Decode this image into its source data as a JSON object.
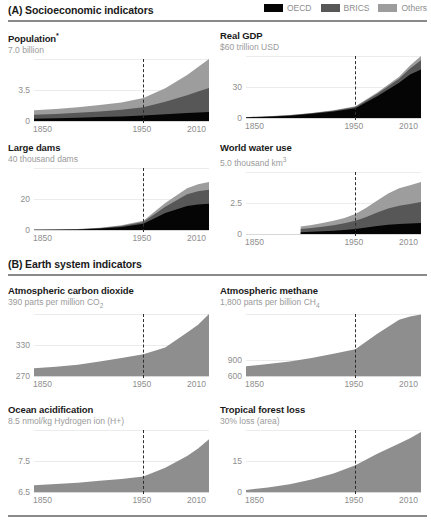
{
  "figure": {
    "sections": [
      {
        "id": "A",
        "label": "(A) Socioeconomic indicators",
        "has_legend": true,
        "legend": [
          {
            "name": "OECD",
            "color": "#050505"
          },
          {
            "name": "BRICS",
            "color": "#575757"
          },
          {
            "name": "Others",
            "color": "#9d9d9d"
          }
        ]
      },
      {
        "id": "B",
        "label": "(B) Earth system indicators",
        "has_legend": false,
        "legend": []
      }
    ]
  },
  "chart_data": [
    {
      "type": "area",
      "stacked": true,
      "title": "Population",
      "title_footnote": "*",
      "subtitle": "7.0 billion",
      "xlabel": "",
      "ylabel": "",
      "xlim": [
        1850,
        2010
      ],
      "ylim": [
        0,
        7.0
      ],
      "xticks": [
        1850,
        1950,
        2010
      ],
      "yticks": [
        0,
        3.5
      ],
      "grid": true,
      "annotation_year": 1950,
      "x": [
        1850,
        1870,
        1890,
        1910,
        1930,
        1950,
        1970,
        1990,
        2000,
        2010
      ],
      "series": [
        {
          "name": "OECD",
          "values": [
            0.25,
            0.3,
            0.36,
            0.44,
            0.52,
            0.62,
            0.76,
            0.9,
            0.97,
            1.03
          ]
        },
        {
          "name": "BRICS",
          "values": [
            0.45,
            0.5,
            0.56,
            0.64,
            0.74,
            0.92,
            1.4,
            2.0,
            2.35,
            2.7
          ]
        },
        {
          "name": "Others",
          "values": [
            0.5,
            0.55,
            0.62,
            0.72,
            0.84,
            1.06,
            1.54,
            2.3,
            2.78,
            3.27
          ]
        }
      ],
      "totals": [
        1.2,
        1.35,
        1.54,
        1.8,
        2.1,
        2.6,
        3.7,
        5.2,
        6.1,
        7.0
      ]
    },
    {
      "type": "area",
      "stacked": true,
      "title": "Real GDP",
      "subtitle": "$60 trillion USD",
      "xlim": [
        1850,
        2010
      ],
      "ylim": [
        0,
        60
      ],
      "xticks": [
        1850,
        1950,
        2010
      ],
      "yticks": [
        0,
        30
      ],
      "grid": true,
      "annotation_year": 1950,
      "x": [
        1850,
        1870,
        1890,
        1910,
        1930,
        1950,
        1970,
        1990,
        2000,
        2010
      ],
      "series": [
        {
          "name": "OECD",
          "values": [
            0.6,
            1.2,
            2.2,
            4.0,
            6.2,
            9.5,
            21.0,
            34.0,
            42.0,
            47.0
          ]
        },
        {
          "name": "BRICS",
          "values": [
            0.2,
            0.3,
            0.4,
            0.6,
            0.8,
            1.2,
            2.4,
            4.0,
            6.0,
            9.0
          ]
        },
        {
          "name": "Others",
          "values": [
            0.1,
            0.2,
            0.2,
            0.3,
            0.4,
            0.6,
            1.2,
            2.0,
            2.8,
            4.0
          ]
        }
      ],
      "totals": [
        0.9,
        1.7,
        2.8,
        4.9,
        7.4,
        11.3,
        24.6,
        40.0,
        50.8,
        60.0
      ]
    },
    {
      "type": "area",
      "stacked": true,
      "title": "Large dams",
      "subtitle": "40 thousand dams",
      "xlim": [
        1850,
        2010
      ],
      "ylim": [
        0,
        40
      ],
      "xticks": [
        1850,
        1950,
        2010
      ],
      "yticks": [
        0,
        20
      ],
      "grid": true,
      "annotation_year": 1950,
      "x": [
        1850,
        1870,
        1890,
        1910,
        1930,
        1950,
        1970,
        1990,
        2000,
        2010
      ],
      "series": [
        {
          "name": "OECD",
          "values": [
            0.1,
            0.2,
            0.4,
            0.9,
            2.0,
            4.0,
            11.0,
            15.5,
            16.5,
            17.0
          ]
        },
        {
          "name": "BRICS",
          "values": [
            0.0,
            0.1,
            0.1,
            0.3,
            0.6,
            1.2,
            4.0,
            7.5,
            8.5,
            9.0
          ]
        },
        {
          "name": "Others",
          "values": [
            0.0,
            0.0,
            0.1,
            0.2,
            0.4,
            0.8,
            2.5,
            4.0,
            4.5,
            5.0
          ]
        }
      ],
      "totals": [
        0.1,
        0.3,
        0.6,
        1.4,
        3.0,
        6.0,
        17.5,
        27.0,
        29.5,
        31.0
      ]
    },
    {
      "type": "area",
      "stacked": true,
      "title": "World water use",
      "subtitle_prefix": "5.0 thousand km",
      "subtitle_sup": "3",
      "subtitle": "5.0 thousand km3",
      "xlim": [
        1850,
        2010
      ],
      "ylim": [
        0,
        5.0
      ],
      "xticks": [
        1850,
        1950,
        2010
      ],
      "yticks": [
        0,
        2.5
      ],
      "grid": true,
      "annotation_year": 1950,
      "data_starts": 1900,
      "x": [
        1900,
        1910,
        1920,
        1930,
        1940,
        1950,
        1960,
        1970,
        1980,
        1990,
        2000,
        2010
      ],
      "series": [
        {
          "name": "OECD",
          "values": [
            0.15,
            0.18,
            0.22,
            0.26,
            0.32,
            0.4,
            0.52,
            0.64,
            0.74,
            0.8,
            0.84,
            0.88
          ]
        },
        {
          "name": "BRICS",
          "values": [
            0.25,
            0.3,
            0.36,
            0.44,
            0.54,
            0.66,
            0.86,
            1.1,
            1.32,
            1.48,
            1.58,
            1.7
          ]
        },
        {
          "name": "Others",
          "values": [
            0.2,
            0.24,
            0.3,
            0.36,
            0.44,
            0.56,
            0.74,
            0.96,
            1.2,
            1.4,
            1.52,
            1.62
          ]
        }
      ],
      "totals": [
        0.6,
        0.72,
        0.88,
        1.06,
        1.3,
        1.62,
        2.12,
        2.7,
        3.26,
        3.68,
        3.94,
        4.2
      ]
    },
    {
      "type": "area",
      "stacked": false,
      "title": "Atmospheric carbon dioxide",
      "subtitle_prefix": "390 parts per million CO",
      "subtitle_sub": "2",
      "subtitle": "390 parts per million CO2",
      "xlim": [
        1850,
        2010
      ],
      "ylim": [
        270,
        390
      ],
      "xticks": [
        1850,
        1950,
        2010
      ],
      "yticks": [
        270,
        330
      ],
      "grid": true,
      "annotation_year": 1950,
      "x": [
        1850,
        1870,
        1890,
        1910,
        1930,
        1950,
        1970,
        1990,
        2000,
        2010
      ],
      "values": [
        285,
        288,
        292,
        298,
        305,
        312,
        325,
        354,
        369,
        390
      ]
    },
    {
      "type": "area",
      "stacked": false,
      "title": "Atmospheric methane",
      "subtitle_prefix": "1,800 parts per billion CH",
      "subtitle_sub": "4",
      "subtitle": "1,800 parts per billion CH4",
      "xlim": [
        1850,
        2010
      ],
      "ylim": [
        600,
        1800
      ],
      "xticks": [
        1850,
        1950,
        2010
      ],
      "yticks": [
        600,
        900
      ],
      "grid": true,
      "annotation_year": 1950,
      "x": [
        1850,
        1870,
        1890,
        1910,
        1930,
        1950,
        1970,
        1990,
        2000,
        2010
      ],
      "values": [
        790,
        830,
        880,
        950,
        1030,
        1120,
        1420,
        1690,
        1750,
        1790
      ]
    },
    {
      "type": "area",
      "stacked": false,
      "title": "Ocean acidification",
      "subtitle": "8.5 nmol/kg Hydrogen ion (H+)",
      "xlim": [
        1850,
        2010
      ],
      "ylim": [
        6.5,
        8.5
      ],
      "xticks": [
        1850,
        1950,
        2010
      ],
      "yticks": [
        6.5,
        7.5
      ],
      "grid": true,
      "annotation_year": 1950,
      "x": [
        1850,
        1870,
        1890,
        1910,
        1930,
        1950,
        1970,
        1990,
        2000,
        2010
      ],
      "values": [
        6.72,
        6.76,
        6.8,
        6.86,
        6.92,
        7.0,
        7.28,
        7.66,
        7.9,
        8.2
      ]
    },
    {
      "type": "area",
      "stacked": false,
      "title": "Tropical forest loss",
      "subtitle": "30% loss (area)",
      "xlim": [
        1850,
        2010
      ],
      "ylim": [
        0,
        30
      ],
      "xticks": [
        1850,
        1950,
        2010
      ],
      "yticks": [
        0,
        15
      ],
      "grid": true,
      "annotation_year": 1950,
      "x": [
        1850,
        1870,
        1890,
        1910,
        1930,
        1950,
        1970,
        1990,
        2000,
        2010
      ],
      "values": [
        1.0,
        2.2,
        3.8,
        6.0,
        9.0,
        13.0,
        18.5,
        23.5,
        26.0,
        29.0
      ]
    }
  ]
}
